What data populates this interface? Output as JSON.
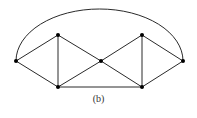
{
  "figure": {
    "caption": "(b)",
    "colors": {
      "edge": "#2a2a2a",
      "node": "#000000",
      "background": "#ffffff"
    }
  },
  "graph": {
    "nodes": [
      {
        "id": "left",
        "x": 16,
        "y": 61
      },
      {
        "id": "top-left",
        "x": 58,
        "y": 35
      },
      {
        "id": "bottom-left",
        "x": 58,
        "y": 87
      },
      {
        "id": "center",
        "x": 101,
        "y": 61
      },
      {
        "id": "top-right",
        "x": 142,
        "y": 35
      },
      {
        "id": "bottom-right",
        "x": 142,
        "y": 87
      },
      {
        "id": "right",
        "x": 183,
        "y": 61
      }
    ],
    "edges": [
      [
        "left",
        "top-left"
      ],
      [
        "left",
        "bottom-left"
      ],
      [
        "top-left",
        "bottom-left"
      ],
      [
        "top-left",
        "center"
      ],
      [
        "bottom-left",
        "center"
      ],
      [
        "bottom-left",
        "bottom-right"
      ],
      [
        "center",
        "top-right"
      ],
      [
        "center",
        "bottom-right"
      ],
      [
        "top-right",
        "bottom-right"
      ],
      [
        "top-right",
        "right"
      ],
      [
        "bottom-right",
        "right"
      ]
    ],
    "arc": {
      "from": "left",
      "to": "right",
      "apex_y": 9
    }
  }
}
